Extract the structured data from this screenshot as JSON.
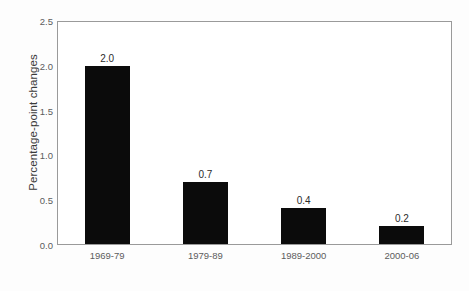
{
  "chart_data": {
    "type": "bar",
    "title": "",
    "subtitle": "",
    "xlabel": "",
    "ylabel": "Percentage-point changes",
    "categories": [
      "1969-79",
      "1979-89",
      "1989-2000",
      "2000-06"
    ],
    "values": [
      2.0,
      0.7,
      0.4,
      0.2
    ],
    "value_labels": [
      "2.0",
      "0.7",
      "0.4",
      "0.2"
    ],
    "ylim": [
      0.0,
      2.5
    ],
    "ytick_values": [
      2.5,
      2.0,
      1.5,
      1.0,
      0.5,
      0.0
    ],
    "ytick_labels": [
      "2.5",
      "2.0",
      "1.5",
      "1.0",
      "0.5",
      "0.0"
    ],
    "grid": false,
    "legend": false,
    "legend_position": "none",
    "bar_color": "#0b0b0b",
    "frame_color": "#9a9a9a",
    "text_color": "#5c5c5c",
    "background_color": "#ffffff"
  }
}
